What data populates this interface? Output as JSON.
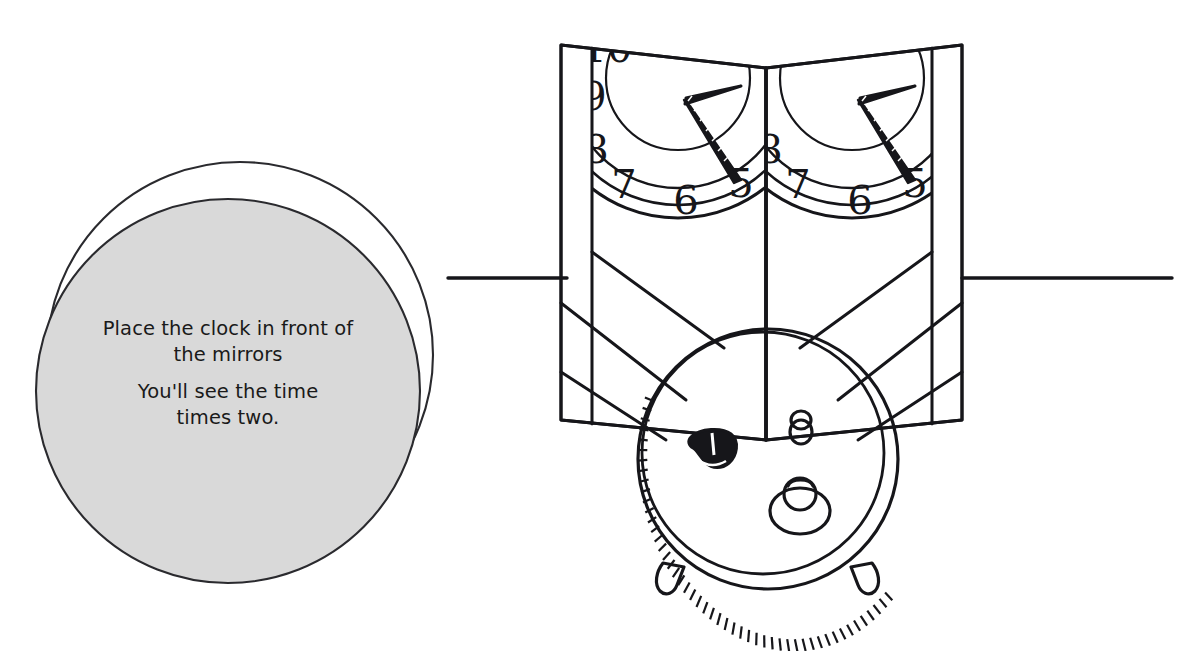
{
  "page": {
    "title": "Place the clock in front of the mirrors",
    "background_color": "#ffffff",
    "ink_color": "#16161a",
    "width": 1201,
    "height": 651
  },
  "speech_bubble": {
    "name": "instruction-bubble",
    "fill_color": "#d9d9d9",
    "stroke_color": "#2a2a2e",
    "paragraphs": [
      {
        "lines": [
          "Place the clock in front of",
          "the mirrors"
        ]
      },
      {
        "lines": [
          "You'll see the time",
          "times two."
        ]
      }
    ],
    "line_1": "Place the clock in front of",
    "line_2": "the mirrors",
    "line_3": "You'll see the time",
    "line_4": "times two."
  },
  "mirrors": {
    "name": "hinged-mirror-pair",
    "panel_count": 2,
    "left_panel_label": "left-mirror-panel",
    "right_panel_label": "right-mirror-panel",
    "hinge_label": "mirror-hinge",
    "reflections": [
      {
        "panel": "left",
        "visible_numerals": [
          "10",
          "9",
          "8",
          "7",
          "6",
          "5"
        ],
        "hands": [
          "hour-hand",
          "minute-hand"
        ]
      },
      {
        "panel": "right",
        "visible_numerals": [
          "8",
          "7",
          "6",
          "5"
        ],
        "hands": [
          "hour-hand",
          "minute-hand"
        ]
      }
    ]
  },
  "clock": {
    "name": "alarm-clock-rear-view",
    "parts": [
      "clock-body",
      "winding-key",
      "alarm-set-knob",
      "alarm-switch-lever",
      "left-foot",
      "right-foot",
      "knurled-rim"
    ]
  },
  "table": {
    "name": "table-edge-line",
    "left_segment": "table-edge-left",
    "right_segment": "table-edge-right"
  },
  "reflection_rays": {
    "name": "sight-line-rays",
    "count": 4
  }
}
